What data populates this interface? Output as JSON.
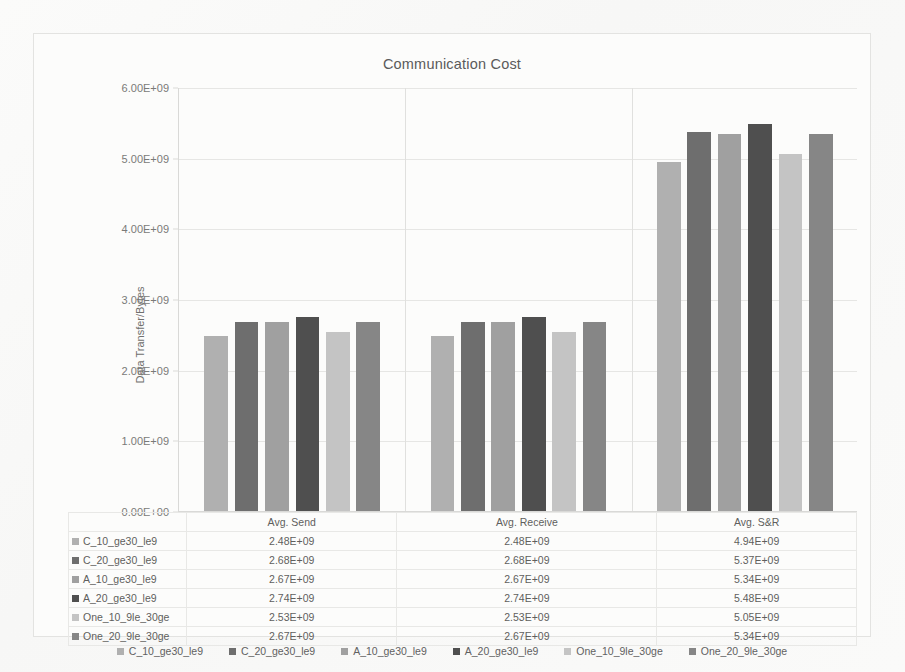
{
  "chart_data": {
    "type": "bar",
    "title": "Communication Cost",
    "xlabel": "",
    "ylabel": "Data Transfer/Bytes",
    "categories": [
      "Avg. Send",
      "Avg. Receive",
      "Avg. S&R"
    ],
    "ylim": [
      0,
      6000000000
    ],
    "yticks": [
      "0.00E+00",
      "1.00E+09",
      "2.00E+09",
      "3.00E+09",
      "4.00E+09",
      "5.00E+09",
      "6.00E+09"
    ],
    "ytick_values": [
      0,
      1000000000,
      2000000000,
      3000000000,
      4000000000,
      5000000000,
      6000000000
    ],
    "grid": true,
    "legend_position": "bottom",
    "series": [
      {
        "name": "C_10_ge30_le9",
        "color": "#b0b0b0",
        "values": [
          2480000000,
          2480000000,
          4940000000
        ],
        "labels": [
          "2.48E+09",
          "2.48E+09",
          "4.94E+09"
        ]
      },
      {
        "name": "C_20_ge30_le9",
        "color": "#6e6e6e",
        "values": [
          2680000000,
          2680000000,
          5370000000
        ],
        "labels": [
          "2.68E+09",
          "2.68E+09",
          "5.37E+09"
        ]
      },
      {
        "name": "A_10_ge30_le9",
        "color": "#a0a0a0",
        "values": [
          2670000000,
          2670000000,
          5340000000
        ],
        "labels": [
          "2.67E+09",
          "2.67E+09",
          "5.34E+09"
        ]
      },
      {
        "name": "A_20_ge30_le9",
        "color": "#4f4f4f",
        "values": [
          2740000000,
          2740000000,
          5480000000
        ],
        "labels": [
          "2.74E+09",
          "2.74E+09",
          "5.48E+09"
        ]
      },
      {
        "name": "One_10_9le_30ge",
        "color": "#c4c4c4",
        "values": [
          2530000000,
          2530000000,
          5050000000
        ],
        "labels": [
          "2.53E+09",
          "2.53E+09",
          "5.05E+09"
        ]
      },
      {
        "name": "One_20_9le_30ge",
        "color": "#868686",
        "values": [
          2670000000,
          2670000000,
          5340000000
        ],
        "labels": [
          "2.67E+09",
          "2.67E+09",
          "5.34E+09"
        ]
      }
    ]
  },
  "table": {
    "corner_label": "",
    "column_headers": [
      "Avg. Send",
      "Avg. Receive",
      "Avg. S&R"
    ],
    "rows": [
      {
        "name": "C_10_ge30_le9",
        "cells": [
          "2.48E+09",
          "2.48E+09",
          "4.94E+09"
        ]
      },
      {
        "name": "C_20_ge30_le9",
        "cells": [
          "2.68E+09",
          "2.68E+09",
          "5.37E+09"
        ]
      },
      {
        "name": "A_10_ge30_le9",
        "cells": [
          "2.67E+09",
          "2.67E+09",
          "5.34E+09"
        ]
      },
      {
        "name": "A_20_ge30_le9",
        "cells": [
          "2.74E+09",
          "2.74E+09",
          "5.48E+09"
        ]
      },
      {
        "name": "One_10_9le_30ge",
        "cells": [
          "2.53E+09",
          "2.53E+09",
          "5.05E+09"
        ]
      },
      {
        "name": "One_20_9le_30ge",
        "cells": [
          "2.67E+09",
          "2.67E+09",
          "5.34E+09"
        ]
      }
    ]
  }
}
